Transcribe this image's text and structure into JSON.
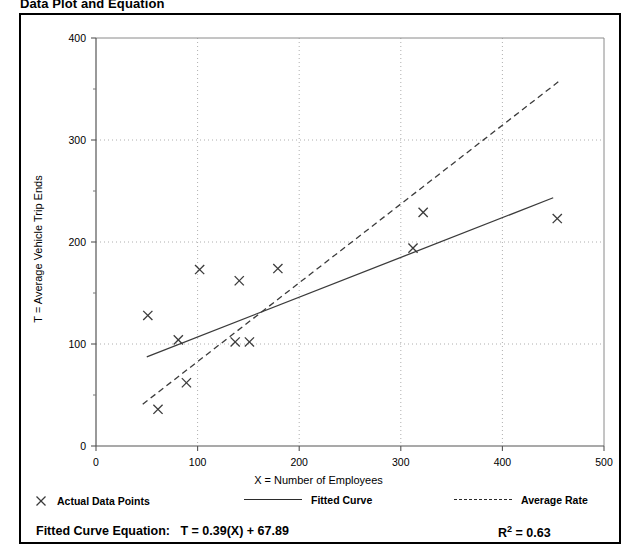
{
  "figure": {
    "title": "Data Plot and Equation"
  },
  "legend": {
    "items": [
      {
        "label": "Actual Data Points",
        "marker": "x-marker-icon"
      },
      {
        "label": "Fitted Curve",
        "marker": "solid-line-icon"
      },
      {
        "label": "Average Rate",
        "marker": "dashed-line-icon"
      }
    ]
  },
  "equation": {
    "label": "Fitted Curve Equation:",
    "expression": "T = 0.39(X) + 67.89",
    "r_squared_symbol": "R",
    "r_squared_exponent": "2",
    "r_squared_value": "= 0.63"
  },
  "chart_data": {
    "type": "scatter",
    "title": "Data Plot and Equation",
    "xlabel": "X = Number of Employees",
    "ylabel": "T = Average Vehicle Trip Ends",
    "xlim": [
      0,
      500
    ],
    "ylim": [
      0,
      400
    ],
    "xticks": [
      0,
      100,
      200,
      300,
      400,
      500
    ],
    "yticks": [
      0,
      100,
      200,
      300,
      400
    ],
    "y_minor_ticks": [
      50,
      150,
      250,
      350
    ],
    "grid": true,
    "grid_style": "dotted",
    "legend_position": "below-axes",
    "series": [
      {
        "name": "Actual Data Points",
        "type": "scatter",
        "marker": "x",
        "points": [
          [
            51,
            128
          ],
          [
            61,
            36
          ],
          [
            81,
            104
          ],
          [
            89,
            62
          ],
          [
            102,
            173
          ],
          [
            137,
            102
          ],
          [
            141,
            162
          ],
          [
            151,
            102
          ],
          [
            179,
            174
          ],
          [
            312,
            194
          ],
          [
            322,
            229
          ],
          [
            454,
            223
          ]
        ]
      },
      {
        "name": "Fitted Curve",
        "type": "line",
        "style": "solid",
        "equation": "T = 0.39(X) + 67.89",
        "slope": 0.39,
        "intercept": 67.89,
        "r_squared": 0.63,
        "x_range": [
          50,
          450
        ],
        "endpoints": [
          [
            50,
            87.4
          ],
          [
            450,
            243.4
          ]
        ]
      },
      {
        "name": "Average Rate",
        "type": "line",
        "style": "dashed",
        "x_range": [
          46,
          455
        ],
        "endpoints": [
          [
            46,
            41
          ],
          [
            455,
            357
          ]
        ]
      }
    ]
  }
}
